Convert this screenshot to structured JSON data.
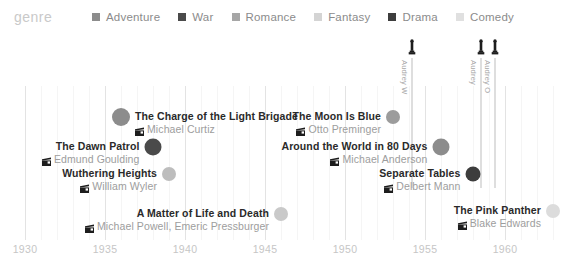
{
  "legend": {
    "title": "genre",
    "items": [
      {
        "label": "Adventure",
        "color": "#8c8c8c"
      },
      {
        "label": "War",
        "color": "#4a4a4a"
      },
      {
        "label": "Romance",
        "color": "#a6a6a6"
      },
      {
        "label": "Fantasy",
        "color": "#d4d4d4"
      },
      {
        "label": "Drama",
        "color": "#3d3d3d"
      },
      {
        "label": "Comedy",
        "color": "#e0e0e0"
      }
    ]
  },
  "axis": {
    "label": "",
    "ticks": [
      "1930",
      "1935",
      "1940",
      "1945",
      "1950",
      "1955",
      "1960"
    ],
    "tick_values": [
      1930,
      1935,
      1940,
      1945,
      1950,
      1955,
      1960
    ],
    "tick_color": "#c6c6c6"
  },
  "awards": [
    {
      "label": "Audrey W",
      "year": 1954.2,
      "count": 1
    },
    {
      "label": "Audrey",
      "year": 1958.5,
      "count": 1
    },
    {
      "label": "Audrey O",
      "year": 1959.4,
      "count": 1
    }
  ],
  "chart_data": {
    "type": "scatter",
    "title": "",
    "subtitle": "",
    "xlabel": "",
    "ylabel": "",
    "xlim": [
      1929,
      1962
    ],
    "grid": true,
    "legend_position": "top",
    "legend_title": "genre",
    "categories": [
      "Adventure",
      "War",
      "Romance",
      "Fantasy",
      "Drama",
      "Comedy"
    ],
    "points": [
      {
        "title": "The Charge of the Light Brigade",
        "director": "Michael Curtiz",
        "year": 1936,
        "genre": "Adventure",
        "color": "#8c8c8c",
        "size": 18,
        "label_side": "right"
      },
      {
        "title": "The Dawn Patrol",
        "director": "Edmund Goulding",
        "year": 1938,
        "genre": "War",
        "color": "#4a4a4a",
        "size": 17,
        "label_side": "left"
      },
      {
        "title": "Wuthering Heights",
        "director": "William Wyler",
        "year": 1939,
        "genre": "Romance",
        "color": "#bdbdbd",
        "size": 14,
        "label_side": "left"
      },
      {
        "title": "A Matter of Life and Death",
        "director": "Michael Powell, Emeric Pressburger",
        "year": 1946,
        "genre": "Fantasy",
        "color": "#c9c9c9",
        "size": 14,
        "label_side": "left"
      },
      {
        "title": "The Moon Is Blue",
        "director": "Otto Preminger",
        "year": 1953,
        "genre": "Romance",
        "color": "#9c9c9c",
        "size": 14,
        "label_side": "left"
      },
      {
        "title": "Around the World in 80 Days",
        "director": "Michael Anderson",
        "year": 1956,
        "genre": "Adventure",
        "color": "#8c8c8c",
        "size": 17,
        "label_side": "left"
      },
      {
        "title": "Separate Tables",
        "director": "Delbert Mann",
        "year": 1958,
        "genre": "Drama",
        "color": "#3d3d3d",
        "size": 15,
        "label_side": "left"
      },
      {
        "title": "The Pink Panther",
        "director": "Blake Edwards",
        "year": 1963,
        "genre": "Comedy",
        "color": "#dcdcdc",
        "size": 14,
        "label_side": "left"
      }
    ]
  }
}
